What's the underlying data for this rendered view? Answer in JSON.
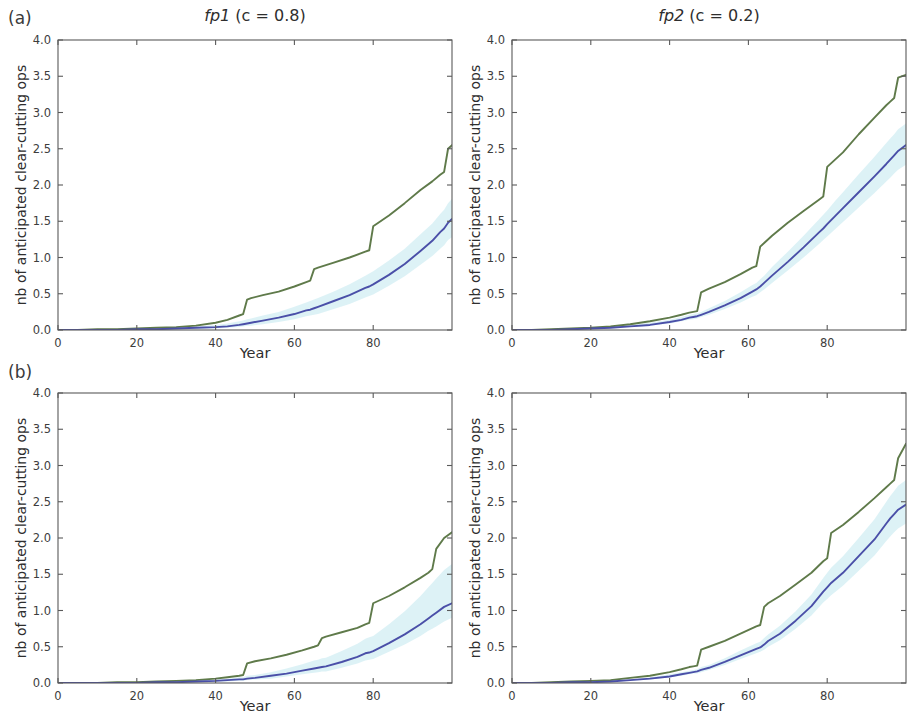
{
  "figure": {
    "width": 913,
    "height": 721,
    "background": "#ffffff"
  },
  "panels": [
    {
      "letter": "(a)",
      "title_prefix": "fp1",
      "title_suffix": " (c = 0.8)",
      "title_full": "fp1 (c = 0.8)",
      "row": 0,
      "col": 0
    },
    {
      "letter": "",
      "title_prefix": "fp2",
      "title_suffix": " (c = 0.2)",
      "title_full": "fp2 (c = 0.2)",
      "row": 0,
      "col": 1
    },
    {
      "letter": "(b)",
      "title_prefix": "",
      "title_suffix": "",
      "title_full": "",
      "row": 1,
      "col": 0
    },
    {
      "letter": "",
      "title_prefix": "",
      "title_suffix": "",
      "title_full": "",
      "row": 1,
      "col": 1
    }
  ],
  "colors": {
    "green": "#5f7a4a",
    "blue": "#4a4fa8",
    "band": "#d7f0f4",
    "axis": "#5a5a5a",
    "text": "#2e2e2e"
  },
  "axes": {
    "xlabel": "Year",
    "ylabel": "nb of anticipated clear-cutting ops",
    "xlim": [
      0,
      100
    ],
    "ylim": [
      0,
      4.0
    ],
    "xticks": [
      0,
      20,
      40,
      60,
      80
    ],
    "xtick_labels": [
      "0",
      "20",
      "40",
      "60",
      "80"
    ],
    "yticks": [
      0.0,
      0.5,
      1.0,
      1.5,
      2.0,
      2.5,
      3.0,
      3.5,
      4.0
    ],
    "ytick_labels": [
      "0.0",
      "0.5",
      "1.0",
      "1.5",
      "2.0",
      "2.5",
      "3.0",
      "3.5",
      "4.0"
    ],
    "grid": false,
    "minor_xticks": [
      10,
      30,
      50,
      70,
      90
    ]
  },
  "chart_data": [
    {
      "id": "panel-a-fp1",
      "type": "line",
      "title": "fp1 (c = 0.8)",
      "panel_letter": "(a)",
      "xlabel": "Year",
      "ylabel": "nb of anticipated clear-cutting ops",
      "xlim": [
        0,
        100
      ],
      "ylim": [
        0,
        4.0
      ],
      "grid": false,
      "legend": "none",
      "x": [
        0,
        5,
        10,
        15,
        20,
        25,
        30,
        35,
        40,
        43,
        46,
        47,
        48,
        49,
        52,
        56,
        60,
        63,
        64,
        65,
        66,
        70,
        74,
        78,
        79,
        80,
        84,
        88,
        92,
        95,
        97,
        98,
        99,
        100
      ],
      "series": [
        {
          "name": "green-upper",
          "color": "#5f7a4a",
          "values": [
            0.0,
            0.0,
            0.01,
            0.01,
            0.02,
            0.03,
            0.04,
            0.06,
            0.1,
            0.14,
            0.2,
            0.22,
            0.42,
            0.44,
            0.48,
            0.53,
            0.6,
            0.66,
            0.68,
            0.84,
            0.86,
            0.93,
            1.0,
            1.08,
            1.1,
            1.43,
            1.58,
            1.75,
            1.93,
            2.05,
            2.14,
            2.18,
            2.5,
            2.55
          ]
        },
        {
          "name": "blue-mean",
          "color": "#4a4fa8",
          "values": [
            0.0,
            0.0,
            0.0,
            0.0,
            0.01,
            0.01,
            0.02,
            0.03,
            0.04,
            0.05,
            0.07,
            0.08,
            0.09,
            0.1,
            0.13,
            0.17,
            0.22,
            0.27,
            0.28,
            0.3,
            0.32,
            0.4,
            0.48,
            0.58,
            0.6,
            0.63,
            0.76,
            0.91,
            1.09,
            1.23,
            1.35,
            1.4,
            1.48,
            1.53
          ]
        }
      ],
      "ci_band": {
        "name": "confidence-band",
        "color": "#d7f0f4",
        "lower": [
          0.0,
          0.0,
          0.0,
          0.0,
          0.0,
          0.0,
          0.01,
          0.01,
          0.02,
          0.03,
          0.04,
          0.05,
          0.06,
          0.06,
          0.08,
          0.11,
          0.15,
          0.19,
          0.2,
          0.21,
          0.22,
          0.29,
          0.36,
          0.45,
          0.47,
          0.49,
          0.61,
          0.74,
          0.9,
          1.02,
          1.12,
          1.17,
          1.24,
          1.28
        ],
        "upper": [
          0.0,
          0.0,
          0.01,
          0.01,
          0.02,
          0.03,
          0.04,
          0.05,
          0.07,
          0.09,
          0.12,
          0.13,
          0.15,
          0.16,
          0.2,
          0.25,
          0.32,
          0.38,
          0.4,
          0.42,
          0.44,
          0.53,
          0.63,
          0.75,
          0.78,
          0.81,
          0.96,
          1.12,
          1.32,
          1.47,
          1.6,
          1.66,
          1.75,
          1.81
        ]
      }
    },
    {
      "id": "panel-a-fp2",
      "type": "line",
      "title": "fp2 (c = 0.2)",
      "panel_letter": "",
      "xlabel": "Year",
      "ylabel": "nb of anticipated clear-cutting ops",
      "xlim": [
        0,
        100
      ],
      "ylim": [
        0,
        4.0
      ],
      "grid": false,
      "legend": "none",
      "x": [
        0,
        5,
        10,
        15,
        20,
        25,
        30,
        35,
        40,
        43,
        45,
        46,
        47,
        48,
        50,
        54,
        58,
        61,
        62,
        63,
        64,
        66,
        70,
        74,
        78,
        79,
        80,
        82,
        84,
        88,
        92,
        95,
        96,
        97,
        98,
        100
      ],
      "series": [
        {
          "name": "green-upper",
          "color": "#5f7a4a",
          "values": [
            0.0,
            0.0,
            0.01,
            0.02,
            0.03,
            0.05,
            0.08,
            0.12,
            0.17,
            0.21,
            0.24,
            0.25,
            0.26,
            0.52,
            0.57,
            0.66,
            0.77,
            0.86,
            0.88,
            1.15,
            1.2,
            1.3,
            1.48,
            1.64,
            1.8,
            1.84,
            2.25,
            2.35,
            2.45,
            2.7,
            2.93,
            3.1,
            3.15,
            3.2,
            3.48,
            3.52
          ]
        },
        {
          "name": "blue-mean",
          "color": "#4a4fa8",
          "values": [
            0.0,
            0.0,
            0.0,
            0.01,
            0.02,
            0.03,
            0.05,
            0.07,
            0.11,
            0.14,
            0.17,
            0.18,
            0.19,
            0.21,
            0.25,
            0.34,
            0.44,
            0.53,
            0.56,
            0.6,
            0.65,
            0.75,
            0.94,
            1.14,
            1.35,
            1.4,
            1.46,
            1.57,
            1.68,
            1.9,
            2.12,
            2.29,
            2.35,
            2.41,
            2.47,
            2.55
          ]
        }
      ],
      "ci_band": {
        "name": "confidence-band",
        "color": "#d7f0f4",
        "lower": [
          0.0,
          0.0,
          0.0,
          0.0,
          0.01,
          0.02,
          0.04,
          0.06,
          0.09,
          0.12,
          0.14,
          0.15,
          0.16,
          0.18,
          0.21,
          0.29,
          0.38,
          0.46,
          0.48,
          0.52,
          0.56,
          0.65,
          0.82,
          1.0,
          1.19,
          1.24,
          1.29,
          1.39,
          1.49,
          1.69,
          1.89,
          2.05,
          2.1,
          2.16,
          2.21,
          2.28
        ],
        "upper": [
          0.0,
          0.0,
          0.01,
          0.02,
          0.03,
          0.05,
          0.07,
          0.1,
          0.14,
          0.18,
          0.21,
          0.22,
          0.23,
          0.25,
          0.3,
          0.4,
          0.52,
          0.62,
          0.65,
          0.7,
          0.75,
          0.87,
          1.08,
          1.3,
          1.53,
          1.59,
          1.65,
          1.78,
          1.9,
          2.15,
          2.39,
          2.58,
          2.64,
          2.7,
          2.77,
          2.85
        ]
      }
    },
    {
      "id": "panel-b-fp1",
      "type": "line",
      "title": "",
      "panel_letter": "(b)",
      "xlabel": "Year",
      "ylabel": "nb of anticipated clear-cutting ops",
      "xlim": [
        0,
        100
      ],
      "ylim": [
        0,
        4.0
      ],
      "grid": false,
      "legend": "none",
      "x": [
        0,
        5,
        10,
        15,
        20,
        25,
        30,
        35,
        40,
        43,
        46,
        47,
        48,
        50,
        54,
        58,
        62,
        65,
        66,
        67,
        68,
        72,
        76,
        78,
        79,
        80,
        84,
        88,
        92,
        94,
        95,
        96,
        98,
        100
      ],
      "series": [
        {
          "name": "green-upper",
          "color": "#5f7a4a",
          "values": [
            0.0,
            0.0,
            0.0,
            0.01,
            0.01,
            0.02,
            0.03,
            0.04,
            0.06,
            0.08,
            0.1,
            0.11,
            0.27,
            0.3,
            0.34,
            0.39,
            0.45,
            0.5,
            0.52,
            0.62,
            0.64,
            0.7,
            0.76,
            0.81,
            0.83,
            1.1,
            1.2,
            1.32,
            1.45,
            1.52,
            1.57,
            1.85,
            2.0,
            2.08
          ]
        },
        {
          "name": "blue-mean",
          "color": "#4a4fa8",
          "values": [
            0.0,
            0.0,
            0.0,
            0.0,
            0.0,
            0.01,
            0.01,
            0.02,
            0.03,
            0.04,
            0.05,
            0.05,
            0.06,
            0.07,
            0.1,
            0.13,
            0.17,
            0.2,
            0.21,
            0.22,
            0.23,
            0.29,
            0.36,
            0.41,
            0.42,
            0.44,
            0.55,
            0.67,
            0.81,
            0.89,
            0.93,
            0.97,
            1.05,
            1.1
          ]
        }
      ],
      "ci_band": {
        "name": "confidence-band",
        "color": "#d7f0f4",
        "lower": [
          0.0,
          0.0,
          0.0,
          0.0,
          0.0,
          0.0,
          0.01,
          0.01,
          0.02,
          0.02,
          0.03,
          0.03,
          0.04,
          0.05,
          0.06,
          0.09,
          0.12,
          0.14,
          0.15,
          0.16,
          0.16,
          0.21,
          0.27,
          0.31,
          0.32,
          0.33,
          0.43,
          0.53,
          0.65,
          0.72,
          0.75,
          0.78,
          0.85,
          0.9
        ],
        "upper": [
          0.0,
          0.0,
          0.0,
          0.01,
          0.01,
          0.02,
          0.02,
          0.03,
          0.05,
          0.06,
          0.08,
          0.08,
          0.1,
          0.11,
          0.15,
          0.2,
          0.26,
          0.31,
          0.32,
          0.34,
          0.35,
          0.44,
          0.54,
          0.61,
          0.63,
          0.65,
          0.81,
          0.99,
          1.2,
          1.32,
          1.38,
          1.44,
          1.56,
          1.64
        ]
      }
    },
    {
      "id": "panel-b-fp2",
      "type": "line",
      "title": "",
      "panel_letter": "",
      "xlabel": "Year",
      "ylabel": "nb of anticipated clear-cutting ops",
      "xlim": [
        0,
        100
      ],
      "ylim": [
        0,
        4.0
      ],
      "grid": false,
      "legend": "none",
      "x": [
        0,
        5,
        10,
        15,
        20,
        25,
        30,
        35,
        40,
        43,
        45,
        46,
        47,
        48,
        50,
        54,
        58,
        62,
        63,
        64,
        65,
        68,
        72,
        76,
        79,
        80,
        81,
        84,
        88,
        92,
        95,
        96,
        97,
        98,
        100
      ],
      "series": [
        {
          "name": "green-upper",
          "color": "#5f7a4a",
          "values": [
            0.0,
            0.0,
            0.01,
            0.02,
            0.03,
            0.04,
            0.07,
            0.1,
            0.15,
            0.19,
            0.22,
            0.23,
            0.24,
            0.46,
            0.5,
            0.58,
            0.68,
            0.78,
            0.8,
            1.05,
            1.1,
            1.2,
            1.36,
            1.52,
            1.68,
            1.72,
            2.07,
            2.18,
            2.36,
            2.55,
            2.7,
            2.75,
            2.8,
            3.1,
            3.3
          ]
        },
        {
          "name": "blue-mean",
          "color": "#4a4fa8",
          "values": [
            0.0,
            0.0,
            0.0,
            0.01,
            0.01,
            0.02,
            0.04,
            0.06,
            0.09,
            0.12,
            0.14,
            0.15,
            0.16,
            0.18,
            0.21,
            0.29,
            0.38,
            0.47,
            0.49,
            0.53,
            0.58,
            0.68,
            0.86,
            1.06,
            1.26,
            1.32,
            1.38,
            1.52,
            1.75,
            1.98,
            2.2,
            2.27,
            2.33,
            2.39,
            2.46
          ]
        }
      ],
      "ci_band": {
        "name": "confidence-band",
        "color": "#d7f0f4",
        "lower": [
          0.0,
          0.0,
          0.0,
          0.0,
          0.01,
          0.02,
          0.03,
          0.05,
          0.08,
          0.1,
          0.12,
          0.13,
          0.13,
          0.15,
          0.18,
          0.25,
          0.33,
          0.41,
          0.43,
          0.46,
          0.5,
          0.59,
          0.75,
          0.93,
          1.11,
          1.16,
          1.21,
          1.34,
          1.55,
          1.76,
          1.96,
          2.02,
          2.08,
          2.13,
          2.2
        ],
        "upper": [
          0.0,
          0.0,
          0.01,
          0.01,
          0.02,
          0.03,
          0.05,
          0.08,
          0.12,
          0.15,
          0.17,
          0.18,
          0.19,
          0.22,
          0.25,
          0.34,
          0.45,
          0.55,
          0.57,
          0.62,
          0.67,
          0.79,
          0.99,
          1.22,
          1.45,
          1.52,
          1.59,
          1.75,
          2.0,
          2.26,
          2.5,
          2.58,
          2.65,
          2.72,
          2.8
        ]
      }
    }
  ]
}
